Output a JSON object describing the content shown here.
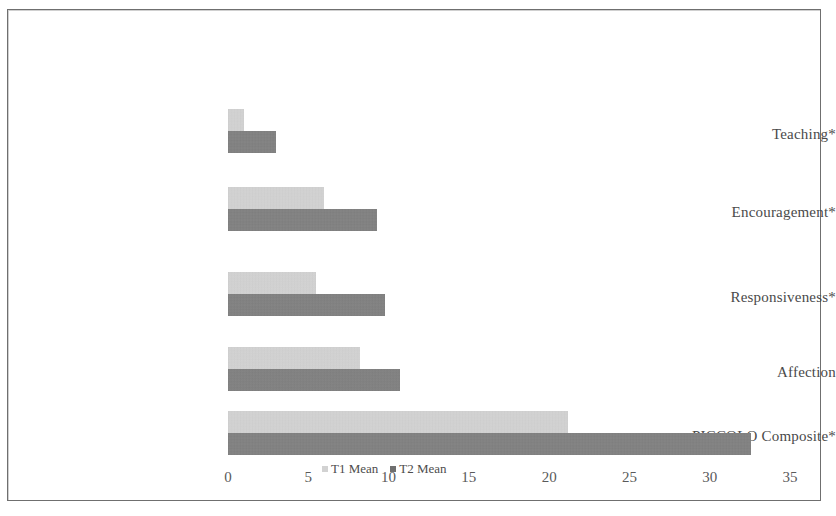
{
  "chart_data": {
    "type": "bar",
    "orientation": "horizontal",
    "title": "",
    "subtitle": "",
    "xlabel": "",
    "ylabel": "",
    "xlim": [
      0,
      35
    ],
    "xticks": [
      "0",
      "5",
      "10",
      "15",
      "20",
      "25",
      "30",
      "35"
    ],
    "grid": false,
    "legend_position": "bottom-center",
    "categories": [
      "Teaching*",
      "Encouragement*",
      "Responsiveness*",
      "Affection",
      "PICCOLO Composite*"
    ],
    "series": [
      {
        "name": "T1 Mean",
        "color": "#d8d8d8",
        "values": [
          1.0,
          6.0,
          5.5,
          8.2,
          21.2
        ]
      },
      {
        "name": "T2 Mean",
        "color": "#848484",
        "values": [
          3.0,
          9.3,
          9.8,
          10.7,
          32.6
        ]
      }
    ],
    "legend": [
      "T1 Mean",
      "T2 Mean"
    ],
    "annotations": [
      "* indicates statistically significant change"
    ]
  },
  "axis": {
    "ticks": [
      {
        "label": "0",
        "value": 0
      },
      {
        "label": "5",
        "value": 5
      },
      {
        "label": "10",
        "value": 10
      },
      {
        "label": "15",
        "value": 15
      },
      {
        "label": "20",
        "value": 20
      },
      {
        "label": "25",
        "value": 25
      },
      {
        "label": "30",
        "value": 30
      },
      {
        "label": "35",
        "value": 35
      }
    ]
  },
  "legend": {
    "items": [
      {
        "label": "T1 Mean",
        "swatch": "t1"
      },
      {
        "label": "T2 Mean",
        "swatch": "t2"
      }
    ]
  },
  "colors": {
    "t1": "#d8d8d8",
    "t2": "#848484",
    "frame": "#6f6f6f",
    "text": "#4a4a4a"
  }
}
